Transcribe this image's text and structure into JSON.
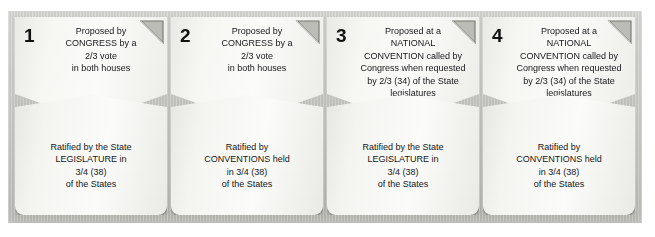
{
  "diagram": {
    "frame_color": "#c6c6c2",
    "card_color": "#f7f7f4",
    "fold_color": "#6f6f6a",
    "text_color": "#17171a"
  },
  "panels": [
    {
      "number": "1",
      "proposal_lines": [
        "Proposed by",
        "CONGRESS by a",
        "2/3 vote",
        "in both houses"
      ],
      "ratification_lines": [
        "Ratified by the State",
        "LEGISLATURE in",
        "3/4 (38)",
        "of the States"
      ]
    },
    {
      "number": "2",
      "proposal_lines": [
        "Proposed by",
        "CONGRESS by a",
        "2/3 vote",
        "in both houses"
      ],
      "ratification_lines": [
        "Ratified by",
        "CONVENTIONS held",
        "in 3/4 (38)",
        "of the States"
      ]
    },
    {
      "number": "3",
      "proposal_lines": [
        "Proposed at a",
        "NATIONAL",
        "CONVENTION called by",
        "Congress when requested",
        "by 2/3 (34) of the State",
        "legislatures"
      ],
      "ratification_lines": [
        "Ratified by the State",
        "LEGISLATURE in",
        "3/4 (38)",
        "of the States"
      ]
    },
    {
      "number": "4",
      "proposal_lines": [
        "Proposed at a",
        "NATIONAL",
        "CONVENTION called by",
        "Congress when requested",
        "by 2/3 (34) of the State",
        "legislatures"
      ],
      "ratification_lines": [
        "Ratified by",
        "CONVENTIONS held",
        "in 3/4 (38)",
        "of the States"
      ]
    }
  ]
}
